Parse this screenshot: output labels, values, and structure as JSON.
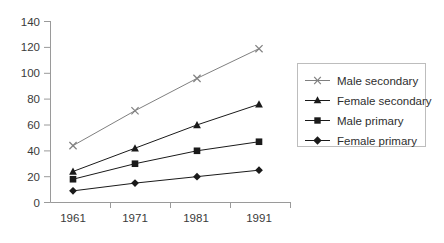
{
  "chart_data": {
    "type": "line",
    "title": "",
    "subtitle": "",
    "xlabel": "",
    "ylabel": "",
    "categories": [
      "1961",
      "1971",
      "1981",
      "1991"
    ],
    "x": [
      1961,
      1971,
      1981,
      1991
    ],
    "xlim": [
      1961,
      1991
    ],
    "ylim": [
      0,
      140
    ],
    "ytick_labels": [
      "0",
      "20",
      "40",
      "60",
      "80",
      "100",
      "120",
      "140"
    ],
    "ytick_values": [
      0,
      20,
      40,
      60,
      80,
      100,
      120,
      140
    ],
    "xtick_labels": [
      "1961",
      "1971",
      "1981",
      "1991"
    ],
    "grid": false,
    "legend_position": "right",
    "series": [
      {
        "name": "Male secondary",
        "marker": "x-cross",
        "color": "#808080",
        "values": [
          44,
          71,
          96,
          119
        ]
      },
      {
        "name": "Female secondary",
        "marker": "triangle",
        "color": "#1a1a1a",
        "values": [
          24,
          42,
          60,
          76
        ]
      },
      {
        "name": "Male primary",
        "marker": "square",
        "color": "#1a1a1a",
        "values": [
          18,
          30,
          40,
          47
        ]
      },
      {
        "name": "Female primary",
        "marker": "diamond",
        "color": "#1a1a1a",
        "values": [
          9,
          15,
          20,
          25
        ]
      }
    ],
    "legend_entries": [
      "Male secondary",
      "Female secondary",
      "Male primary",
      "Female primary"
    ]
  },
  "axis": {
    "y_tick_0": "0",
    "y_tick_1": "20",
    "y_tick_2": "40",
    "y_tick_3": "60",
    "y_tick_4": "80",
    "y_tick_5": "100",
    "y_tick_6": "120",
    "y_tick_7": "140",
    "x_tick_0": "1961",
    "x_tick_1": "1971",
    "x_tick_2": "1981",
    "x_tick_3": "1991"
  },
  "legend": {
    "entry_0": "Male secondary",
    "entry_1": "Female secondary",
    "entry_2": "Male primary",
    "entry_3": "Female primary"
  },
  "colors": {
    "axis": "#9a9a9a",
    "tick_text": "#3a3a3a",
    "series_light": "#808080",
    "series_dark": "#1a1a1a",
    "legend_border": "#bdbdbd",
    "background": "#ffffff"
  }
}
